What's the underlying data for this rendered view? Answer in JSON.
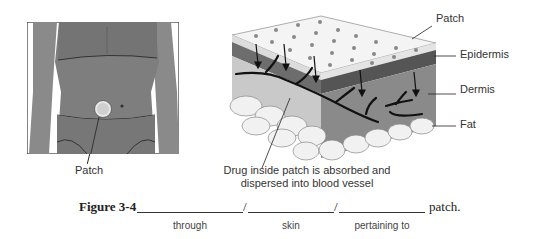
{
  "left_panel": {
    "patch_label": "Patch"
  },
  "right_panel": {
    "labels": {
      "patch": "Patch",
      "epidermis": "Epidermis",
      "dermis": "Dermis",
      "fat": "Fat"
    },
    "caption_line1": "Drug inside patch is absorbed and",
    "caption_line2": "dispersed into blood vessel"
  },
  "figure": {
    "label": "Figure 3-4",
    "separator": "/",
    "suffix": "patch.",
    "blanks": [
      {
        "hint": "through"
      },
      {
        "hint": "skin"
      },
      {
        "hint": "pertaining to"
      }
    ]
  }
}
